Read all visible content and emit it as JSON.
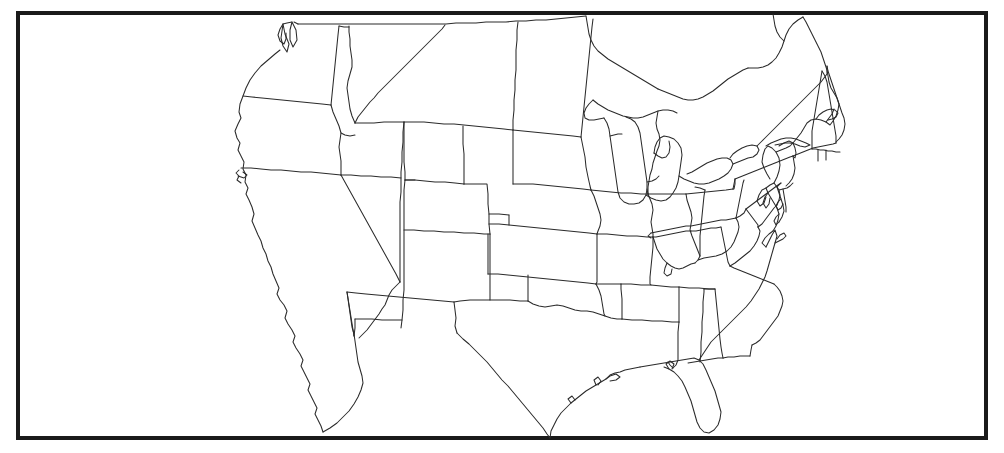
{
  "figure": {
    "kind": "map",
    "title": "",
    "subtitle": "",
    "caption": "",
    "description": "Blank outline map of the contiguous United States showing state boundaries, drawn as thin black lines on a white background inside a thick black rectangular border.",
    "region": "Contiguous United States",
    "projection": "conic",
    "labels_shown": false,
    "legend_shown": false,
    "graticule_shown": false
  },
  "colors": {
    "background": "#ffffff",
    "land_fill": "#ffffff",
    "state_boundary": "#2b2b2b",
    "frame": "#1a1a1a"
  },
  "frame": {
    "x": 16,
    "y": 11,
    "width": 972,
    "height": 429,
    "stroke_width": 4
  },
  "states": [
    "Washington",
    "Oregon",
    "California",
    "Nevada",
    "Idaho",
    "Montana",
    "Wyoming",
    "Utah",
    "Arizona",
    "Colorado",
    "New Mexico",
    "North Dakota",
    "South Dakota",
    "Nebraska",
    "Kansas",
    "Oklahoma",
    "Texas",
    "Minnesota",
    "Iowa",
    "Missouri",
    "Arkansas",
    "Louisiana",
    "Wisconsin",
    "Illinois",
    "Michigan",
    "Indiana",
    "Ohio",
    "Kentucky",
    "Tennessee",
    "Mississippi",
    "Alabama",
    "Georgia",
    "Florida",
    "South Carolina",
    "North Carolina",
    "Virginia",
    "West Virginia",
    "Maryland",
    "Delaware",
    "Pennsylvania",
    "New Jersey",
    "New York",
    "Connecticut",
    "Rhode Island",
    "Massachusetts",
    "Vermont",
    "New Hampshire",
    "Maine"
  ],
  "state_count": 48,
  "annotations": []
}
